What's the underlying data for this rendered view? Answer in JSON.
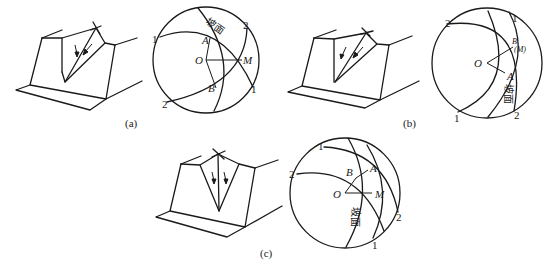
{
  "figure": {
    "panels": [
      {
        "id": "a",
        "caption": "(a)",
        "stereonet": {
          "slope_label": "坡面",
          "points": {
            "A": "A",
            "O": "O",
            "M": "M",
            "B": "B"
          },
          "plane_labels": {
            "one_top": "1",
            "one_bottom": "1",
            "two_top": "2",
            "two_bottom": "2"
          }
        }
      },
      {
        "id": "b",
        "caption": "(b)",
        "stereonet": {
          "slope_label": "坡面",
          "points": {
            "B": "B",
            "M": "(M)",
            "O": "O",
            "A": "A"
          },
          "plane_labels": {
            "two_top": "2",
            "one_top": "1",
            "one_bottom": "1",
            "two_bottom": "2"
          }
        }
      },
      {
        "id": "c",
        "caption": "(c)",
        "stereonet": {
          "slope_label": "坡面",
          "points": {
            "B": "B",
            "A": "A",
            "O": "O",
            "M": "M"
          },
          "plane_labels": {
            "one_top": "1",
            "two_left": "2",
            "two_right": "2",
            "one_bottom": "1"
          }
        }
      }
    ]
  }
}
